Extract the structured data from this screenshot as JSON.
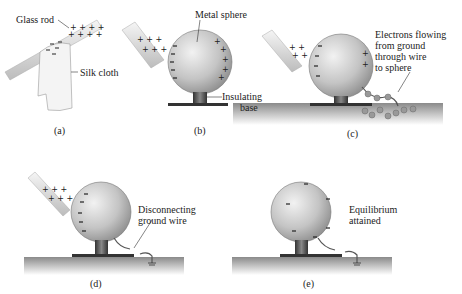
{
  "panels": [
    {
      "id": "a",
      "caption": "(a)",
      "labels": {
        "rod": "Glass rod",
        "cloth": "Silk cloth"
      }
    },
    {
      "id": "b",
      "caption": "(b)",
      "labels": {
        "sphere": "Metal sphere",
        "base_line1": "Insulating",
        "base_line2": "base"
      }
    },
    {
      "id": "c",
      "caption": "(c)",
      "labels": {
        "line1": "Electrons flowing",
        "line2": "from ground",
        "line3": "through wire",
        "line4": "to sphere"
      }
    },
    {
      "id": "d",
      "caption": "(d)",
      "labels": {
        "line1": "Disconnecting",
        "line2": "ground wire"
      }
    },
    {
      "id": "e",
      "caption": "(e)",
      "labels": {
        "line1": "Equilibrium",
        "line2": "attained"
      }
    }
  ],
  "colors": {
    "sphere": "#bdbdbd",
    "rod": "#e6e6e6",
    "ground": "#9e9e9e",
    "electron": "#999999"
  }
}
